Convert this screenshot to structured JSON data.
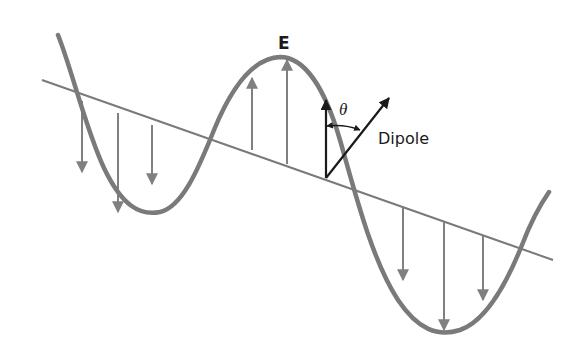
{
  "diagram": {
    "type": "transverse electromagnetic wave with dipole",
    "labels": {
      "field": "E",
      "angle": "θ",
      "dipole": "Dipole"
    },
    "colors": {
      "wave": "#7a7a7a",
      "axis": "#7a7a7a",
      "field_vectors": "#808080",
      "dipole": "#1a1a1a",
      "text": "#1a1a1a",
      "background": "#ffffff"
    },
    "axis": {
      "x1": 42,
      "y1": 80,
      "x2": 553,
      "y2": 260
    },
    "field_vectors": [
      {
        "direction": "down",
        "x": 82,
        "y_base": 101,
        "y_tip": 172
      },
      {
        "direction": "down",
        "x": 118,
        "y_base": 113,
        "y_tip": 212
      },
      {
        "direction": "down",
        "x": 152,
        "y_base": 125,
        "y_tip": 182
      },
      {
        "direction": "up",
        "x": 252,
        "y_base": 150,
        "y_tip": 78
      },
      {
        "direction": "up",
        "x": 287,
        "y_base": 164,
        "y_tip": 60
      },
      {
        "direction": "down",
        "x": 403,
        "y_base": 208,
        "y_tip": 280
      },
      {
        "direction": "down",
        "x": 444,
        "y_base": 222,
        "y_tip": 330
      },
      {
        "direction": "down",
        "x": 483,
        "y_base": 236,
        "y_tip": 300
      }
    ],
    "dipole": {
      "origin": {
        "x": 326,
        "y": 178
      },
      "field_tip": {
        "x": 326,
        "y": 98
      },
      "dipole_tip": {
        "x": 390,
        "y": 97
      }
    }
  }
}
